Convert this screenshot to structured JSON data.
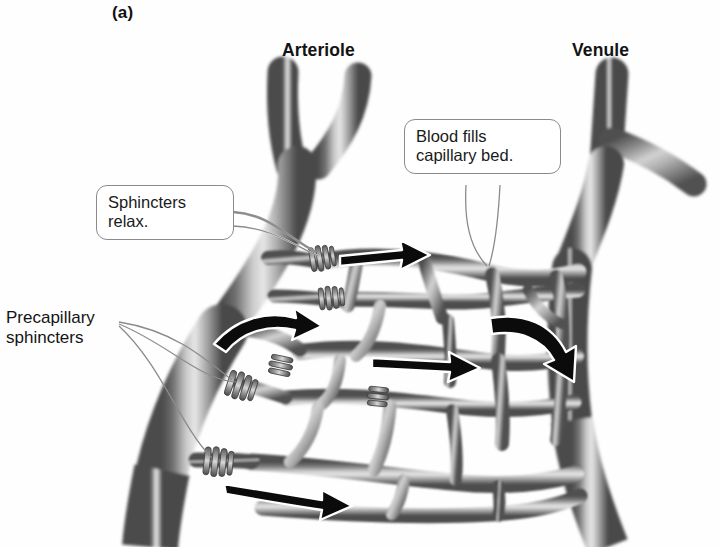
{
  "figure": {
    "panel_label": "(a)",
    "background_color": "#fefefe",
    "ink_color": "#3a3a3a",
    "arrow_color": "#0b0b0b",
    "arrow_outline_color": "#ffffff"
  },
  "headings": {
    "arteriole": "Arteriole",
    "venule": "Venule"
  },
  "callouts": [
    {
      "id": "sphincters-relax",
      "text": "Sphincters\nrelax.",
      "shape": "rounded-box"
    },
    {
      "id": "blood-fills",
      "text": "Blood fills\ncapillary bed.",
      "shape": "rounded-box"
    },
    {
      "id": "precapillary-sphincters",
      "text": "Precapillary\nsphincters",
      "shape": "plain-text"
    }
  ],
  "structures": {
    "arteriole_label": "arteriole trunk with Y branch",
    "venule_label": "venule trunk with side branch",
    "capillary_bed_label": "anastomosing capillary network",
    "sphincter_count": 6,
    "flow_arrow_count": 5
  }
}
